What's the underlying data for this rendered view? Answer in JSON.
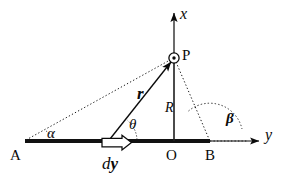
{
  "figure": {
    "colors": {
      "ink": "#0a0a0a",
      "rod": "#111111",
      "background": "#ffffff"
    },
    "axes": {
      "x_label": "x",
      "y_label": "y",
      "origin_label": "O"
    },
    "points": {
      "a_label": "A",
      "b_label": "B",
      "p_label": "P"
    },
    "vectors": {
      "r_label": "r",
      "dy_label_d": "d",
      "dy_label_y": "y"
    },
    "distances": {
      "r_perp_label": "R"
    },
    "angles": {
      "alpha_label": "α",
      "theta_label": "θ",
      "beta_label": "β"
    },
    "geometry": {
      "rod_start_x": 25,
      "rod_end_x": 210,
      "rod_y": 141,
      "origin_x": 174,
      "p_x": 174,
      "p_y": 58,
      "source_x": 110,
      "x_axis_tip_y": 10,
      "y_axis_tip_x": 261
    }
  }
}
